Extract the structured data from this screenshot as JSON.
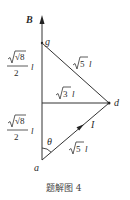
{
  "diagram": {
    "field_label": "B",
    "points": {
      "g": "g",
      "d": "d",
      "a": "a"
    },
    "current_label": "I",
    "angle_label": "θ",
    "segment_labels": {
      "upper_left_num": "√8",
      "upper_left_den": "2",
      "upper_left_unit": "l",
      "lower_left_num": "√8",
      "lower_left_den": "2",
      "lower_left_unit": "l",
      "gd_root": "5",
      "gd_unit": "l",
      "horizontal_root": "3",
      "horizontal_unit": "l",
      "ad_root": "5",
      "ad_unit": "l"
    },
    "caption": "题解图 4"
  }
}
